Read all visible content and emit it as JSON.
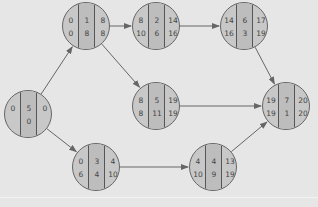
{
  "diagram": {
    "type": "activity-on-node network",
    "colors": {
      "background": "#e6e6e6",
      "node_fill": "#c8c8c8",
      "node_mid_fill": "#bdbdbd",
      "line": "#666666",
      "text": "#444444"
    },
    "nodes": [
      {
        "id": "n1",
        "x": 28,
        "y": 114,
        "top": [
          "0",
          "5",
          "0"
        ],
        "bottom": [
          "",
          "0",
          ""
        ]
      },
      {
        "id": "n2",
        "x": 86,
        "y": 26,
        "top": [
          "0",
          "1",
          "8"
        ],
        "bottom": [
          "0",
          "8",
          "8"
        ]
      },
      {
        "id": "n3",
        "x": 156,
        "y": 26,
        "top": [
          "8",
          "2",
          "14"
        ],
        "bottom": [
          "10",
          "6",
          "16"
        ]
      },
      {
        "id": "n4",
        "x": 244,
        "y": 26,
        "top": [
          "14",
          "6",
          "17"
        ],
        "bottom": [
          "16",
          "3",
          "19"
        ]
      },
      {
        "id": "n5",
        "x": 156,
        "y": 106,
        "top": [
          "8",
          "5",
          "19"
        ],
        "bottom": [
          "8",
          "11",
          "19"
        ]
      },
      {
        "id": "n6",
        "x": 286,
        "y": 106,
        "top": [
          "19",
          "7",
          "20"
        ],
        "bottom": [
          "19",
          "1",
          "20"
        ]
      },
      {
        "id": "n7",
        "x": 96,
        "y": 167,
        "top": [
          "0",
          "3",
          "4"
        ],
        "bottom": [
          "6",
          "4",
          "10"
        ]
      },
      {
        "id": "n8",
        "x": 213,
        "y": 167,
        "top": [
          "4",
          "4",
          "13"
        ],
        "bottom": [
          "10",
          "9",
          "19"
        ]
      }
    ],
    "edges": [
      {
        "from": "n1",
        "to": "n2"
      },
      {
        "from": "n1",
        "to": "n7"
      },
      {
        "from": "n2",
        "to": "n3"
      },
      {
        "from": "n2",
        "to": "n5"
      },
      {
        "from": "n3",
        "to": "n4"
      },
      {
        "from": "n4",
        "to": "n6"
      },
      {
        "from": "n5",
        "to": "n6"
      },
      {
        "from": "n7",
        "to": "n8"
      },
      {
        "from": "n8",
        "to": "n6"
      }
    ]
  }
}
